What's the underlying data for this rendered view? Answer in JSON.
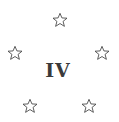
{
  "emblem": {
    "numeral": "IV",
    "numeral_color": "#3a3a3a",
    "star_color": "#444444",
    "stars": [
      {
        "icon": "star-outline-icon",
        "x": 60,
        "y": 20
      },
      {
        "icon": "star-outline-icon",
        "x": 15,
        "y": 53
      },
      {
        "icon": "star-outline-icon",
        "x": 102,
        "y": 53
      },
      {
        "icon": "star-outline-icon",
        "x": 30,
        "y": 106
      },
      {
        "icon": "star-outline-icon",
        "x": 89,
        "y": 106
      }
    ]
  }
}
